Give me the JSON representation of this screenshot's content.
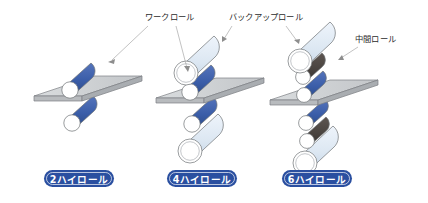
{
  "figure": {
    "background_color": "#ffffff",
    "callouts": [
      {
        "id": "work-roll",
        "label": "ワークロール",
        "text_x": 145,
        "text_y": 20,
        "targets": [
          {
            "x": 108,
            "y": 62
          },
          {
            "x": 186,
            "y": 72
          }
        ]
      },
      {
        "id": "backup-roll",
        "label": "バックアップロール",
        "text_x": 229,
        "text_y": 20,
        "targets": [
          {
            "x": 222,
            "y": 42
          },
          {
            "x": 299,
            "y": 44
          }
        ]
      },
      {
        "id": "intermediate-roll",
        "label": "中間ロール",
        "text_x": 355,
        "text_y": 42,
        "targets": [
          {
            "x": 338,
            "y": 60
          }
        ]
      }
    ],
    "groups": [
      {
        "id": "two-high",
        "badge": "2ハイロール",
        "badge_cx": 79,
        "badge_cy": 180,
        "plate": {
          "cx": 79,
          "cy": 88
        },
        "rolls": [
          {
            "kind": "work",
            "cx": 79,
            "cy": 74,
            "r": 10
          },
          {
            "kind": "work",
            "cx": 79,
            "cy": 102,
            "r": 10
          }
        ]
      },
      {
        "id": "four-high",
        "badge": "4ハイロール",
        "badge_cx": 202,
        "badge_cy": 180,
        "plate": {
          "cx": 202,
          "cy": 90
        },
        "rolls": [
          {
            "kind": "backup",
            "cx": 202,
            "cy": 54,
            "r": 15
          },
          {
            "kind": "work",
            "cx": 202,
            "cy": 80,
            "r": 10
          },
          {
            "kind": "work",
            "cx": 202,
            "cy": 102,
            "r": 10
          },
          {
            "kind": "backup",
            "cx": 202,
            "cy": 128,
            "r": 15
          }
        ]
      },
      {
        "id": "six-high",
        "badge": "6ハイロール",
        "badge_cx": 317,
        "badge_cy": 180,
        "plate": {
          "cx": 317,
          "cy": 92
        },
        "rolls": [
          {
            "kind": "backup",
            "cx": 317,
            "cy": 44,
            "r": 14
          },
          {
            "kind": "intermediate",
            "cx": 317,
            "cy": 66,
            "r": 9
          },
          {
            "kind": "work",
            "cx": 317,
            "cy": 84,
            "r": 9
          },
          {
            "kind": "work",
            "cx": 317,
            "cy": 102,
            "r": 9
          },
          {
            "kind": "intermediate",
            "cx": 317,
            "cy": 120,
            "r": 9
          },
          {
            "kind": "backup",
            "cx": 317,
            "cy": 144,
            "r": 14
          }
        ]
      }
    ]
  },
  "colors": {
    "work_roll": "#3a5da8",
    "work_roll_shadow": "#2f4d8e",
    "intermediate_roll": "#4a4440",
    "intermediate_roll_shadow": "#3b3633",
    "backup_roll": "#dce7f2",
    "backup_roll_shadow": "#c6d6e8",
    "plate_top": "#c9cccе",
    "plate_face": "#d5d8da",
    "plate_edge": "#b2b6b9",
    "badge_fill": "#2a4fa0",
    "badge_ring": "#ffffff",
    "leader_line": "#a8a8a8",
    "text": "#2b2b2b",
    "roll_end": "#ffffff"
  }
}
